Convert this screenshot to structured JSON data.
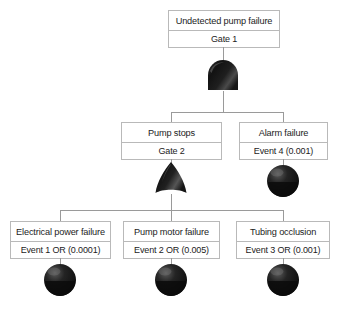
{
  "diagram": {
    "type": "fault-tree",
    "background_color": "#ffffff",
    "line_color": "#9a9a9a",
    "box_border_color": "#b9b9b9",
    "symbol_color": "#1a1a1a",
    "nodes": [
      {
        "id": "top",
        "title": "Undetected pump failure",
        "sub": "Gate 1",
        "symbol": "and-gate",
        "level": 0
      },
      {
        "id": "pump-stops",
        "title": "Pump stops",
        "sub": "Gate 2",
        "symbol": "or-gate",
        "level": 1
      },
      {
        "id": "alarm-failure",
        "title": "Alarm failure",
        "sub": "Event 4 (0.001)",
        "symbol": "basic-event",
        "level": 1
      },
      {
        "id": "electrical-power-failure",
        "title": "Electrical power failure",
        "sub": "Event 1 OR (0.0001)",
        "symbol": "basic-event",
        "level": 2
      },
      {
        "id": "pump-motor-failure",
        "title": "Pump motor failure",
        "sub": "Event 2 OR (0.005)",
        "symbol": "basic-event",
        "level": 2
      },
      {
        "id": "tubing-occlusion",
        "title": "Tubing occlusion",
        "sub": "Event 3 OR (0.001)",
        "symbol": "basic-event",
        "level": 2
      }
    ]
  }
}
